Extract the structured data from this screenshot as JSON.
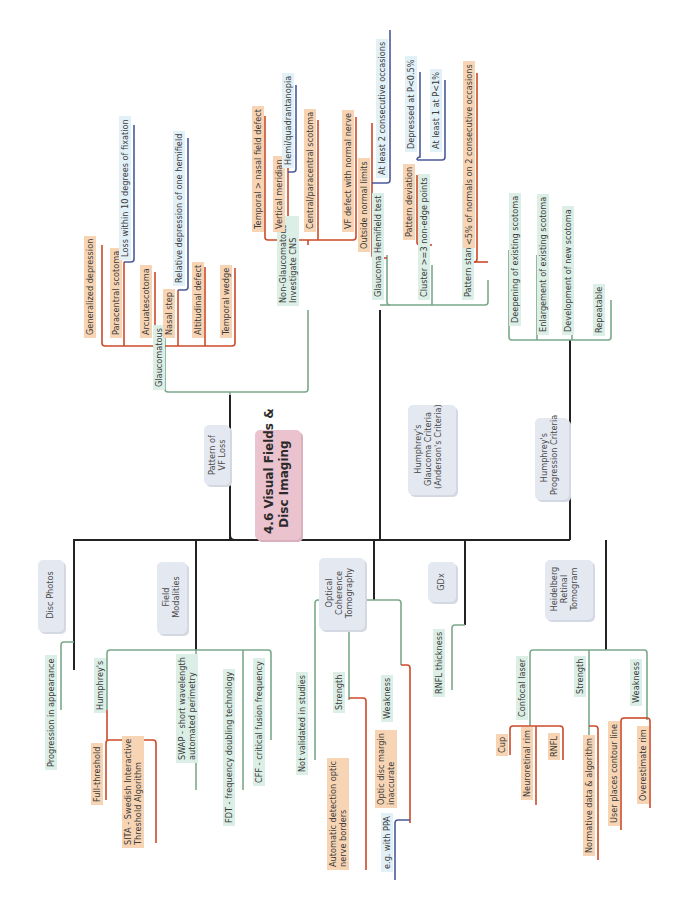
{
  "root": {
    "title": "4.6 Visual Fields &\nDisc Imaging",
    "color": "#ebc3cf"
  },
  "colors": {
    "trunk": "#222222",
    "level1": "#7aa98a",
    "level2": "#cc4a2a",
    "level3": "#4a5a9a",
    "box": "#e4e8f1"
  },
  "branches": {
    "pattern": {
      "label": "Pattern of\nVF Loss",
      "glaucomatous": {
        "label": "Glaucomatous",
        "items": [
          "Generalized depression",
          "Paracentral scotoma",
          "Arcuatescotoma",
          "Nasal step",
          "Altitudinal defect",
          "Temporal wedge"
        ],
        "paracentral_detail": "Loss within 10 degrees of fixation",
        "nasal_step_detail": "Relative depression of one hemifield"
      },
      "non_glaucomatous": {
        "label": "Non-Glaucomatous -\nInvestigate CNS",
        "items": [
          "Temporal > nasal field defect",
          "Vertical meridian",
          "Central/paracentral scotoma",
          "VF defect with normal nerve"
        ],
        "vertical_detail": "Hemi/quadrantanopia"
      }
    },
    "glaucoma_criteria": {
      "label": "Humphrey's\nGlaucoma Criteria\n(Anderson's Criteria)",
      "items": [
        "Glaucoma Hemifield test",
        "Cluster >=3 non-edge points",
        "Pattern standard deviation"
      ],
      "ght_detail": "Outside normal limits",
      "ght_detail2": "At least 2 consecutive occasions",
      "cluster_detail": "Pattern deviation",
      "cluster_sub": [
        "Depressed at P<0.5%",
        "At least 1 at P<1%"
      ],
      "psd_detail": "<5% of normals on 2 consecutive occasions"
    },
    "progression": {
      "label": "Humphrey's\nProgression Criteria",
      "items": [
        "Deepening of existing scotoma",
        "Enlargement of existing scotoma",
        "Development of new scotoma",
        "Repeatable"
      ]
    },
    "disc_photos": {
      "label": "Disc Photos",
      "items": [
        "Progression in appearance"
      ]
    },
    "field_modalities": {
      "label": "Field\nModalities",
      "humphreys": "Humphrey's",
      "humphreys_items": [
        "Full-threshold",
        "SITA - Swedish Interactive\nThreshold Algorithm"
      ],
      "items": [
        "SWAP - short wavelength\nautomated perimetry",
        "FDT - frequency doubling technology",
        "CFF - critical fusion frequency"
      ]
    },
    "oct": {
      "label": "Optical\nCoherence\nTomography",
      "items": [
        "Not validated in studies",
        "Strength",
        "Weakness"
      ],
      "strength_detail": "Automatic detection optic\nnerve borders",
      "weakness_detail": "Optic disc margin\ninaccurate",
      "weakness_sub": "e.g. with PPA"
    },
    "gdx": {
      "label": "GDx",
      "items": [
        "RNFL thickness"
      ]
    },
    "hrt": {
      "label": "Heidelberg\nRetinal\nTomogram",
      "items": [
        "Confocal laser",
        "Strength",
        "Weakness"
      ],
      "confocal_items": [
        "Cup",
        "Neuroretinal rim",
        "RNFL"
      ],
      "strength_detail": "Normative data & algorithm",
      "weakness_items": [
        "User places contour line",
        "Overestimate rim"
      ]
    }
  }
}
